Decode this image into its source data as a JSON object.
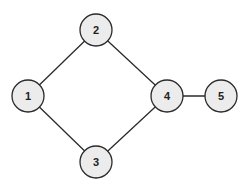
{
  "graph": {
    "nodes": [
      {
        "id": "1",
        "label": "1",
        "x": 28,
        "y": 96
      },
      {
        "id": "2",
        "label": "2",
        "x": 96,
        "y": 30
      },
      {
        "id": "3",
        "label": "3",
        "x": 96,
        "y": 162
      },
      {
        "id": "4",
        "label": "4",
        "x": 167,
        "y": 96
      },
      {
        "id": "5",
        "label": "5",
        "x": 221,
        "y": 96
      }
    ],
    "edges": [
      {
        "from": "1",
        "to": "2"
      },
      {
        "from": "1",
        "to": "3"
      },
      {
        "from": "2",
        "to": "4"
      },
      {
        "from": "3",
        "to": "4"
      },
      {
        "from": "4",
        "to": "5"
      }
    ],
    "node_radius": 16,
    "colors": {
      "node_fill": "#ececec",
      "stroke": "#2a2a2a"
    }
  }
}
